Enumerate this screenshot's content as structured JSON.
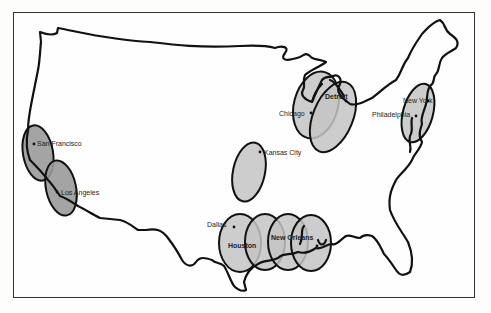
{
  "map": {
    "title": "Continental United States — shaded urban/industrial regions",
    "colors": {
      "outline": "#111111",
      "region_fill": "#c4c4c4",
      "region_fill_dark": "#9a9a9a",
      "background": "#fefefe"
    },
    "regions": [
      {
        "id": "west-coast-north",
        "label": "San Francisco region",
        "cx": 38,
        "cy": 153,
        "rx": 15,
        "ry": 28,
        "rotate": -10,
        "shade": "dark"
      },
      {
        "id": "west-coast-south",
        "label": "Los Angeles region",
        "cx": 60,
        "cy": 188,
        "rx": 15,
        "ry": 28,
        "rotate": -10,
        "shade": "dark"
      },
      {
        "id": "midwest-kc",
        "label": "Kansas City region",
        "cx": 249,
        "cy": 172,
        "rx": 17,
        "ry": 30,
        "rotate": 10,
        "shade": "light"
      },
      {
        "id": "great-lakes-west",
        "label": "Chicago region",
        "cx": 318,
        "cy": 107,
        "rx": 22,
        "ry": 34,
        "rotate": 15,
        "shade": "light"
      },
      {
        "id": "great-lakes-east",
        "label": "Detroit region",
        "cx": 333,
        "cy": 117,
        "rx": 20,
        "ry": 37,
        "rotate": 20,
        "shade": "light"
      },
      {
        "id": "northeast",
        "label": "New York–Philadelphia region",
        "cx": 418,
        "cy": 113,
        "rx": 15,
        "ry": 30,
        "rotate": 15,
        "shade": "light"
      },
      {
        "id": "gulf-1",
        "label": "Houston region",
        "cx": 240,
        "cy": 243,
        "rx": 21,
        "ry": 28,
        "rotate": 0,
        "shade": "light"
      },
      {
        "id": "gulf-2",
        "label": "Gulf region 2",
        "cx": 265,
        "cy": 242,
        "rx": 20,
        "ry": 28,
        "rotate": 0,
        "shade": "light"
      },
      {
        "id": "gulf-3",
        "label": "Gulf region 3",
        "cx": 288,
        "cy": 242,
        "rx": 20,
        "ry": 28,
        "rotate": 0,
        "shade": "light"
      },
      {
        "id": "gulf-4",
        "label": "New Orleans region",
        "cx": 311,
        "cy": 243,
        "rx": 20,
        "ry": 28,
        "rotate": 0,
        "shade": "light"
      }
    ],
    "cities": [
      {
        "name": "San Francisco",
        "x": 34,
        "y": 144,
        "lx": 38,
        "ly": 146,
        "bold": false
      },
      {
        "name": "Los Angeles",
        "x": 57,
        "y": 192,
        "lx": 61,
        "ly": 195,
        "bold": false
      },
      {
        "name": "Kansas City",
        "x": 260,
        "y": 152,
        "lx": 264,
        "ly": 155,
        "bold": false
      },
      {
        "name": "Chicago",
        "x": 311,
        "y": 113,
        "lx": 279,
        "ly": 116,
        "bold": false
      },
      {
        "name": "Detroit",
        "x": 345,
        "y": 100,
        "lx": 325,
        "ly": 99,
        "bold": true
      },
      {
        "name": "New York",
        "x": 427,
        "y": 100,
        "lx": 402,
        "ly": 103,
        "bold": false
      },
      {
        "name": "Philadelphia",
        "x": 415,
        "y": 115,
        "lx": 372,
        "ly": 117,
        "bold": false
      },
      {
        "name": "Dallas",
        "x": 233,
        "y": 226,
        "lx": 207,
        "ly": 226,
        "bold": false
      },
      {
        "name": "Houston",
        "x": 240,
        "y": 246,
        "lx": 229,
        "ly": 247,
        "bold": true
      },
      {
        "name": "New Orleans",
        "x": 317,
        "y": 245,
        "lx": 271,
        "ly": 239,
        "bold": true
      }
    ]
  },
  "labels": {
    "san_francisco": "San Francisco",
    "los_angeles": "Los Angeles",
    "kansas_city": "Kansas City",
    "chicago": "Chicago",
    "detroit": "Detroit",
    "new_york": "New York",
    "philadelphia": "Philadelphia",
    "dallas": "Dallas",
    "houston": "Houston",
    "new_orleans": "New Orleans"
  },
  "caption": {
    "text": ""
  }
}
